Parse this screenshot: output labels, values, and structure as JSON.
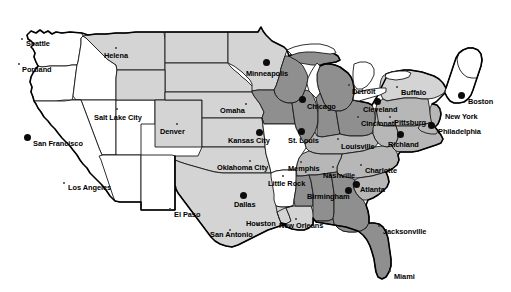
{
  "map": {
    "title": "United States map with shaded states and labeled cities",
    "colors": {
      "background": "#ffffff",
      "state_white": "#ffffff",
      "state_light_gray": "#d4d4d4",
      "state_mid_gray": "#b7b7b7",
      "state_dark_gray": "#8f8f8f",
      "border": "#1a1a1a",
      "outline": "#000000",
      "label_text": "#000000",
      "marker": "#0b0b0b"
    },
    "legend_shades": [
      {
        "name": "unshaded",
        "hex": "#ffffff"
      },
      {
        "name": "light-shaded",
        "hex": "#d4d4d4"
      },
      {
        "name": "medium-shaded",
        "hex": "#b7b7b7"
      },
      {
        "name": "dark-shaded",
        "hex": "#8f8f8f"
      }
    ],
    "cities": [
      {
        "name": "Seattle",
        "label_x": 26,
        "label_y": 40,
        "dot_x": 22,
        "dot_y": 39,
        "marker": "small"
      },
      {
        "name": "Portland",
        "label_x": 22,
        "label_y": 66,
        "dot_x": 19,
        "dot_y": 64,
        "marker": "small"
      },
      {
        "name": "Helena",
        "label_x": 104,
        "label_y": 52,
        "dot_x": 116,
        "dot_y": 48,
        "marker": "small"
      },
      {
        "name": "Salt Lake City",
        "label_x": 94,
        "label_y": 114,
        "dot_x": 117,
        "dot_y": 109,
        "marker": "small"
      },
      {
        "name": "San Francisco",
        "label_x": 33,
        "label_y": 140,
        "dot_x": 27,
        "dot_y": 137,
        "marker": "big"
      },
      {
        "name": "Los Angeles",
        "label_x": 68,
        "label_y": 184,
        "dot_x": 64,
        "dot_y": 183,
        "marker": "small"
      },
      {
        "name": "Denver",
        "label_x": 160,
        "label_y": 128,
        "dot_x": 177,
        "dot_y": 124,
        "marker": "small"
      },
      {
        "name": "El Paso",
        "label_x": 174,
        "label_y": 211,
        "dot_x": 170,
        "dot_y": 209,
        "marker": "small"
      },
      {
        "name": "Minneapolis",
        "label_x": 246,
        "label_y": 70,
        "dot_x": 266,
        "dot_y": 62,
        "marker": "big"
      },
      {
        "name": "Omaha",
        "label_x": 220,
        "label_y": 107,
        "dot_x": 246,
        "dot_y": 104,
        "marker": "small"
      },
      {
        "name": "Kansas City",
        "label_x": 228,
        "label_y": 137,
        "dot_x": 259,
        "dot_y": 132,
        "marker": "big"
      },
      {
        "name": "Oklahoma City",
        "label_x": 217,
        "label_y": 164,
        "dot_x": 250,
        "dot_y": 161,
        "marker": "small"
      },
      {
        "name": "Dallas",
        "label_x": 234,
        "label_y": 201,
        "dot_x": 243,
        "dot_y": 195,
        "marker": "big"
      },
      {
        "name": "Houston",
        "label_x": 246,
        "label_y": 220,
        "dot_x": 258,
        "dot_y": 224,
        "marker": "small"
      },
      {
        "name": "San Antonio",
        "label_x": 210,
        "label_y": 231,
        "dot_x": 230,
        "dot_y": 230,
        "marker": "small"
      },
      {
        "name": "St. Louis",
        "label_x": 288,
        "label_y": 137,
        "dot_x": 301,
        "dot_y": 131,
        "marker": "big"
      },
      {
        "name": "Chicago",
        "label_x": 307,
        "label_y": 103,
        "dot_x": 302,
        "dot_y": 99,
        "marker": "big"
      },
      {
        "name": "Little Rock",
        "label_x": 268,
        "label_y": 180,
        "dot_x": 283,
        "dot_y": 176,
        "marker": "small"
      },
      {
        "name": "Memphis",
        "label_x": 288,
        "label_y": 165,
        "dot_x": 301,
        "dot_y": 162,
        "marker": "small"
      },
      {
        "name": "Nashville",
        "label_x": 323,
        "label_y": 172,
        "dot_x": 333,
        "dot_y": 167,
        "marker": "small"
      },
      {
        "name": "New Orleans",
        "label_x": 279,
        "label_y": 222,
        "dot_x": 296,
        "dot_y": 219,
        "marker": "small"
      },
      {
        "name": "Birmingham",
        "label_x": 307,
        "label_y": 193,
        "dot_x": 348,
        "dot_y": 190,
        "marker": "big"
      },
      {
        "name": "Atlanta",
        "label_x": 360,
        "label_y": 186,
        "dot_x": 356,
        "dot_y": 184,
        "marker": "big"
      },
      {
        "name": "Jacksonville",
        "label_x": 383,
        "label_y": 228,
        "dot_x": 379,
        "dot_y": 226,
        "marker": "small"
      },
      {
        "name": "Miami",
        "label_x": 394,
        "label_y": 273,
        "dot_x": 390,
        "dot_y": 271,
        "marker": "small"
      },
      {
        "name": "Charlotte",
        "label_x": 365,
        "label_y": 167,
        "dot_x": 361,
        "dot_y": 165,
        "marker": "small"
      },
      {
        "name": "Louisville",
        "label_x": 341,
        "label_y": 143,
        "dot_x": 338,
        "dot_y": 139,
        "marker": "small"
      },
      {
        "name": "Cincinnati",
        "label_x": 361,
        "label_y": 120,
        "dot_x": 358,
        "dot_y": 117,
        "marker": "small"
      },
      {
        "name": "Cleveland",
        "label_x": 363,
        "label_y": 106,
        "dot_x": 377,
        "dot_y": 101,
        "marker": "big"
      },
      {
        "name": "Detroit",
        "label_x": 352,
        "label_y": 88,
        "dot_x": 349,
        "dot_y": 85,
        "marker": "small"
      },
      {
        "name": "Buffalo",
        "label_x": 401,
        "label_y": 89,
        "dot_x": 397,
        "dot_y": 87,
        "marker": "small"
      },
      {
        "name": "Pittsburg",
        "label_x": 394,
        "label_y": 119,
        "dot_x": 390,
        "dot_y": 117,
        "marker": "small"
      },
      {
        "name": "Richland",
        "label_x": 388,
        "label_y": 141,
        "dot_x": 400,
        "dot_y": 134,
        "marker": "big"
      },
      {
        "name": "Philadelphia",
        "label_x": 438,
        "label_y": 128,
        "dot_x": 431,
        "dot_y": 125,
        "marker": "big"
      },
      {
        "name": "New York",
        "label_x": 445,
        "label_y": 113,
        "dot_x": 440,
        "dot_y": 110,
        "marker": "small"
      },
      {
        "name": "Boston",
        "label_x": 468,
        "label_y": 98,
        "dot_x": 461,
        "dot_y": 95,
        "marker": "big"
      }
    ]
  }
}
